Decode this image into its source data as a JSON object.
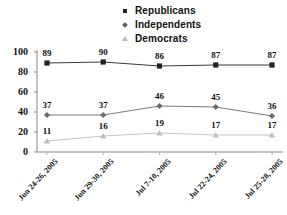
{
  "chart_data": {
    "type": "line",
    "title": "",
    "xlabel": "",
    "ylabel": "",
    "ylim": [
      0,
      100
    ],
    "yticks": [
      0,
      20,
      40,
      60,
      80,
      100
    ],
    "grid": false,
    "legend_position": "top-center",
    "categories": [
      "Jun 24-26, 2005",
      "Jun 29-30, 2005",
      "Jul 7-10, 2005",
      "Jul 22-24, 2005",
      "Jul 25-28, 2005"
    ],
    "series": [
      {
        "name": "Republicans",
        "marker": "square",
        "color": "#222222",
        "values": [
          89,
          90,
          86,
          87,
          87
        ]
      },
      {
        "name": "Independents",
        "marker": "diamond",
        "color": "#6b6b6b",
        "values": [
          37,
          37,
          46,
          45,
          36
        ]
      },
      {
        "name": "Democrats",
        "marker": "triangle",
        "color": "#bdbdbd",
        "values": [
          11,
          16,
          19,
          17,
          17
        ]
      }
    ]
  },
  "axis": {
    "line_color": "#8a8a8a"
  }
}
